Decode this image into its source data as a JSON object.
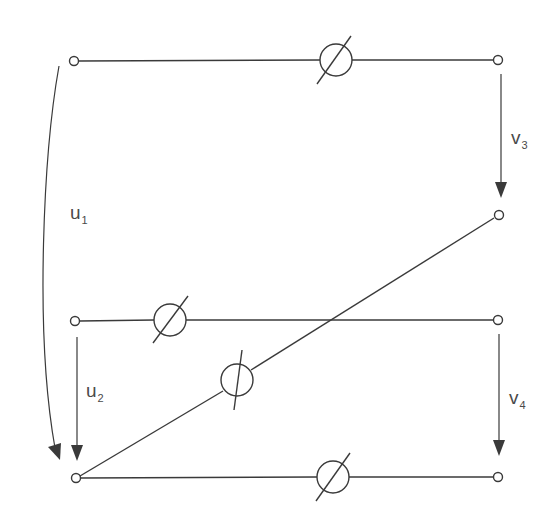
{
  "diagram": {
    "colors": {
      "line": "#3a3a3a",
      "label": "#4a4a4a",
      "background": "#ffffff"
    },
    "labels": {
      "u1": {
        "main": "u",
        "sub": "1"
      },
      "u2": {
        "main": "u",
        "sub": "2"
      },
      "v3": {
        "main": "v",
        "sub": "3"
      },
      "v4": {
        "main": "v",
        "sub": "4"
      }
    },
    "terminals": [
      {
        "id": "top-left",
        "x": 74,
        "y": 61
      },
      {
        "id": "top-right",
        "x": 498,
        "y": 60
      },
      {
        "id": "diag-right",
        "x": 499,
        "y": 215
      },
      {
        "id": "middle-left",
        "x": 75,
        "y": 321
      },
      {
        "id": "middle-right",
        "x": 498,
        "y": 320
      },
      {
        "id": "bottom-left",
        "x": 76,
        "y": 478
      },
      {
        "id": "bottom-right",
        "x": 498,
        "y": 477
      }
    ],
    "meters": [
      {
        "id": "meter-top",
        "x": 336,
        "y": 60
      },
      {
        "id": "meter-middle",
        "x": 170,
        "y": 320
      },
      {
        "id": "meter-diagonal",
        "x": 237,
        "y": 380
      },
      {
        "id": "meter-bottom",
        "x": 333,
        "y": 477
      }
    ],
    "voltage_arrows": [
      {
        "id": "u1",
        "type": "curved",
        "from": "top-left",
        "to": "bottom-left"
      },
      {
        "id": "u2",
        "type": "straight",
        "from": "middle-left",
        "to": "bottom-left"
      },
      {
        "id": "v3",
        "type": "straight",
        "from": "top-right",
        "to": "diag-right"
      },
      {
        "id": "v4",
        "type": "straight",
        "from": "middle-right",
        "to": "bottom-right"
      }
    ]
  }
}
